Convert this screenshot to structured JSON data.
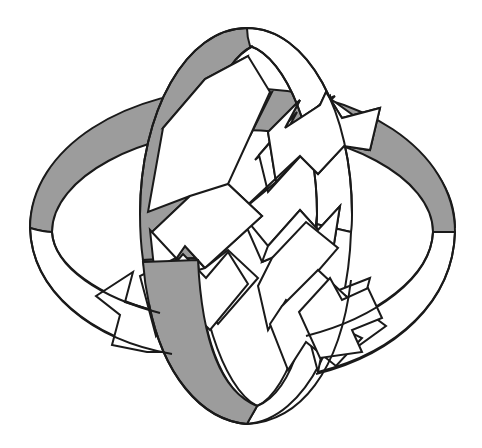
{
  "figure": {
    "alt_text": "Two interlocking elliptical ribbon rings, one oriented horizontally and one vertically, drawn in black outline with gray shading on the far side of each band, with four white arrows pointing outward diagonally from the center forming an X.",
    "background_color": "#ffffff",
    "outline_color": "#1a1a1a",
    "shade_color": "#9c9c9c",
    "fill_color": "#ffffff",
    "stroke_width": 2,
    "canvas": {
      "width": 482,
      "height": 448
    },
    "style": "line-art, black-and-white clip art, grayscale shading"
  },
  "elements": {
    "horizontal_ring": {
      "name": "horizontal ribbon ring",
      "orientation": "horizontal ellipse, viewed from slightly above",
      "far_band_shading": "#9c9c9c",
      "near_band_shading": "#ffffff",
      "center": {
        "x": 242,
        "y": 228
      },
      "radius_x": 212,
      "radius_y": 112,
      "band_depth": 70
    },
    "vertical_ring": {
      "name": "vertical ribbon ring",
      "orientation": "vertical ellipse, tilted",
      "far_band_shading": "#9c9c9c",
      "near_band_shading": "#ffffff",
      "center": {
        "x": 245,
        "y": 228
      },
      "radius_x": 112,
      "radius_y": 200,
      "band_depth": 70
    },
    "arrows": [
      {
        "name": "arrow-northwest",
        "direction": "northwest",
        "angle_deg": 225,
        "fill": "#ffffff"
      },
      {
        "name": "arrow-northeast",
        "direction": "northeast",
        "angle_deg": 315,
        "fill": "#ffffff"
      },
      {
        "name": "arrow-southwest",
        "direction": "southwest",
        "angle_deg": 135,
        "fill": "#ffffff"
      },
      {
        "name": "arrow-southeast",
        "direction": "southeast",
        "angle_deg": 45,
        "fill": "#ffffff"
      }
    ],
    "ring_arrowheads": [
      {
        "name": "horizontal-ring-arrowhead-left",
        "location": "left side of horizontal band"
      },
      {
        "name": "horizontal-ring-arrowhead-right",
        "location": "right side of horizontal band"
      },
      {
        "name": "vertical-ring-arrowhead-top",
        "location": "upper area of vertical band"
      },
      {
        "name": "vertical-ring-arrowhead-bottom",
        "location": "lower area of vertical band"
      }
    ]
  }
}
